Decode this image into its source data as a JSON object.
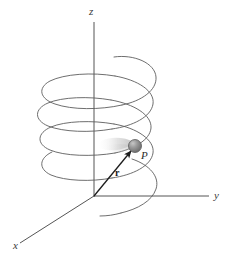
{
  "figure": {
    "caption": "",
    "background_color": "#ffffff",
    "width": 232,
    "height": 262
  },
  "axes": {
    "origin": {
      "x": 94,
      "y": 196
    },
    "items": [
      {
        "name": "z-axis",
        "label": "z",
        "label_x": 89,
        "label_y": 15,
        "from": {
          "x": 94,
          "y": 196
        },
        "to": {
          "x": 94,
          "y": 22
        },
        "color": "#555555"
      },
      {
        "name": "y-axis",
        "label": "y",
        "label_x": 214,
        "label_y": 199,
        "from": {
          "x": 94,
          "y": 196
        },
        "to": {
          "x": 209,
          "y": 196
        },
        "color": "#555555"
      },
      {
        "name": "x-axis",
        "label": "x",
        "label_x": 13,
        "label_y": 249,
        "from": {
          "x": 94,
          "y": 196
        },
        "to": {
          "x": 20,
          "y": 243
        },
        "color": "#555555"
      }
    ]
  },
  "helix": {
    "name": "helical-path",
    "turns": 3.5,
    "center_x": 100,
    "radius_x": 57,
    "radius_y": 17,
    "top_y": 57,
    "bottom_y": 217,
    "color": "#5e5e5e",
    "stroke_width": 0.9
  },
  "point": {
    "name": "particle-p",
    "label": "P",
    "label_x": 141,
    "label_y": 159,
    "x": 135,
    "y": 146,
    "radius": 6.5,
    "fill": "#8c8c8c",
    "highlight": "#bdbdbd",
    "edge": "#5a5a5a"
  },
  "vector": {
    "name": "position-vector-r",
    "label": "r",
    "label_x": 115,
    "label_y": 176,
    "from": {
      "x": 94,
      "y": 196
    },
    "to": {
      "x": 132,
      "y": 150
    },
    "color": "#1d1d1d",
    "stroke_width": 1.3
  },
  "motion_blur": {
    "name": "motion-blur-trail",
    "color": "#c9c9c9"
  }
}
